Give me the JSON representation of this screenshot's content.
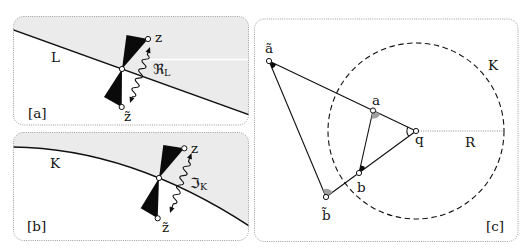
{
  "figure": {
    "panels": [
      {
        "tag": "[a]",
        "line_label": "L",
        "upper_point": "z",
        "lower_point": "z̃",
        "arrow_label": {
          "symbol": "ℜ",
          "subscript": "L"
        }
      },
      {
        "tag": "[b]",
        "curve_label": "K",
        "upper_point": "z",
        "lower_point": "z̃",
        "arrow_label": {
          "symbol": "ℑ",
          "subscript": "K"
        }
      },
      {
        "tag": "[c]",
        "circle_label": "K",
        "radius_label": "R",
        "points": {
          "a_tilde": "ã",
          "a": "a",
          "q": "q",
          "b": "b",
          "b_tilde": "b̃"
        }
      }
    ]
  },
  "colors": {
    "shade": "#ebebeb",
    "ink": "#111111",
    "angle_gray": "#a0a0a0",
    "angle_black": "#0a0a0a",
    "border": "#9c9c9c"
  }
}
